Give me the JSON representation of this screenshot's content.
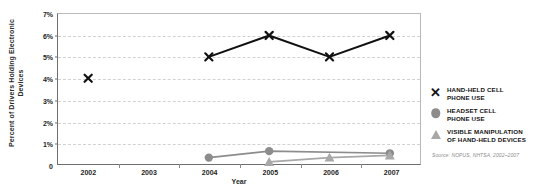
{
  "chart_data": {
    "type": "line",
    "title": "",
    "xlabel": "Year",
    "ylabel": "Percent of Drivers Holding Electronic Devices",
    "categories": [
      "2002",
      "2003",
      "2004",
      "2005",
      "2006",
      "2007"
    ],
    "x": [
      2002,
      2003,
      2004,
      2005,
      2006,
      2007
    ],
    "xlim": [
      2001.5,
      2007.5
    ],
    "ylim": [
      0,
      7
    ],
    "ytick_labels": [
      "0",
      "1%",
      "2%",
      "3%",
      "4%",
      "5%",
      "6%",
      "7%"
    ],
    "ytick_values": [
      0,
      1,
      2,
      3,
      4,
      5,
      6,
      7
    ],
    "grid": true,
    "grid_style": "dashed",
    "legend_position": "right",
    "series": [
      {
        "name": "HAND-HELD CELL PHONE USE",
        "marker": "x",
        "color": "#111111",
        "points": [
          {
            "x": 2002,
            "y": 4.0,
            "connected": false
          },
          {
            "x": 2004,
            "y": 5.0,
            "connected": true
          },
          {
            "x": 2005,
            "y": 6.0,
            "connected": true
          },
          {
            "x": 2006,
            "y": 5.0,
            "connected": true
          },
          {
            "x": 2007,
            "y": 6.0,
            "connected": true
          }
        ]
      },
      {
        "name": "HEADSET CELL PHONE USE",
        "marker": "circle",
        "color": "#8c8c8c",
        "points": [
          {
            "x": 2004,
            "y": 0.3,
            "connected": true
          },
          {
            "x": 2005,
            "y": 0.6,
            "connected": true
          },
          {
            "x": 2007,
            "y": 0.5,
            "connected": true
          }
        ]
      },
      {
        "name": "VISIBLE MANIPULATION OF HAND-HELD DEVICES",
        "marker": "triangle",
        "color": "#a8a8a8",
        "points": [
          {
            "x": 2005,
            "y": 0.1,
            "connected": true
          },
          {
            "x": 2006,
            "y": 0.3,
            "connected": true
          },
          {
            "x": 2007,
            "y": 0.4,
            "connected": true
          }
        ]
      }
    ]
  },
  "legend": {
    "entries": [
      {
        "marker": "x",
        "line1": "HAND-HELD CELL",
        "line2": "PHONE USE"
      },
      {
        "marker": "circle",
        "line1": "HEADSET CELL",
        "line2": "PHONE USE"
      },
      {
        "marker": "triangle",
        "line1": "VISIBLE MANIPULATION",
        "line2": "OF HAND-HELD DEVICES"
      }
    ]
  },
  "source_note": "Source: NOPUS, NHTSA, 2002–2007"
}
